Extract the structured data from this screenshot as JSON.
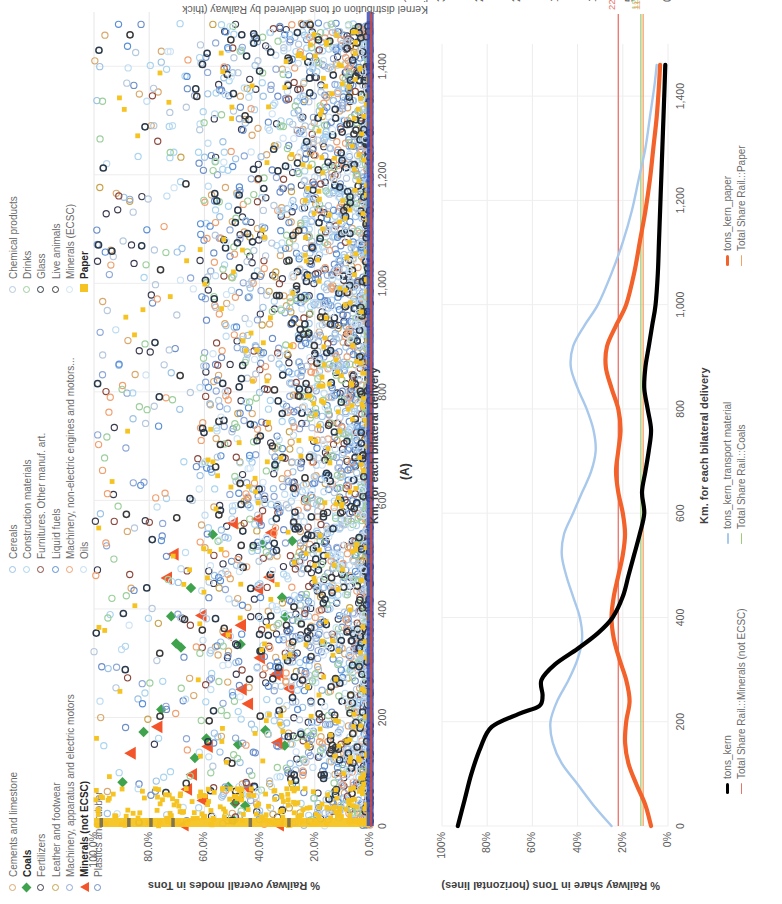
{
  "figure": {
    "panel_label": "(A)"
  },
  "chart_data": [
    {
      "id": "panel_a",
      "type": "scatter",
      "title": "",
      "xlabel": "Km. for each bilateral delivery",
      "ylabel": "% Railway overall modes in Tons",
      "xlim": [
        0,
        1500
      ],
      "ylim": [
        0,
        1.0
      ],
      "xticks": [
        "0",
        "200",
        "400",
        "600",
        "800",
        "1,000",
        "1,200",
        "1,400"
      ],
      "xtickvals": [
        0,
        200,
        400,
        600,
        800,
        1000,
        1200,
        1400
      ],
      "yticks": [
        "0.0%",
        "20.0%",
        "40.0%",
        "60.0%",
        "80.0%",
        "100.0%"
      ],
      "ytickvals": [
        0,
        0.2,
        0.4,
        0.6,
        0.8,
        1.0
      ],
      "grid": true,
      "legend_position": "top-left",
      "series": [
        {
          "name": "Cements and limestone",
          "marker": "circle-open",
          "color": "#d9a86c",
          "count": 260
        },
        {
          "name": "Coals",
          "marker": "diamond-filled",
          "color": "#3fa34d",
          "count": 22,
          "bold": true
        },
        {
          "name": "Fertilizers",
          "marker": "circle-open",
          "color": "#3b3b50",
          "count": 300
        },
        {
          "name": "Leather and footwear",
          "marker": "circle-open",
          "color": "#c9a24a",
          "count": 120
        },
        {
          "name": "Machinery, apparatus and electric motors",
          "marker": "circle-open",
          "color": "#8fa8d8",
          "count": 340
        },
        {
          "name": "Minerals (not ECSC)",
          "marker": "triangle-filled",
          "color": "#f4542a",
          "count": 26,
          "bold": true
        },
        {
          "name": "Plastics and rubber",
          "marker": "circle-open",
          "color": "#6d8fc9",
          "count": 300
        },
        {
          "name": "Cereals",
          "marker": "circle-open",
          "color": "#9dc3e6",
          "count": 320
        },
        {
          "name": "Construction materials",
          "marker": "circle-open",
          "color": "#aad4f0",
          "count": 330
        },
        {
          "name": "Furnitures. Other manuf. art.",
          "marker": "circle-open",
          "color": "#8c4a3f",
          "count": 180
        },
        {
          "name": "Liquid fuels",
          "marker": "circle-open",
          "color": "#5b8fd6",
          "count": 210
        },
        {
          "name": "Machinery, non-electric engines and motors...",
          "marker": "circle-open",
          "color": "#f0a070",
          "count": 230
        },
        {
          "name": "Oils",
          "marker": "circle-open",
          "color": "#bfdcf2",
          "count": 240
        },
        {
          "name": "Chemical products",
          "marker": "circle-open",
          "color": "#b6c8dd",
          "count": 330
        },
        {
          "name": "Drinks",
          "marker": "circle-open",
          "color": "#9ccf9c",
          "count": 270
        },
        {
          "name": "Glass",
          "marker": "circle-open-dark",
          "color": "#2b3a4a",
          "count": 300
        },
        {
          "name": "Live animals",
          "marker": "circle-open-dark",
          "color": "#3a3a3a",
          "count": 140
        },
        {
          "name": "Minerals (ECSC)",
          "marker": "circle-open",
          "color": "#cfe4f5",
          "count": 160
        },
        {
          "name": "Paper",
          "marker": "square-filled",
          "color": "#f5c322",
          "count": 520,
          "bold": true
        }
      ]
    },
    {
      "id": "panel_b",
      "type": "line",
      "title": "",
      "xlabel": "Km. for each bilateral delivery",
      "ylabel": "% Railway share in Tons (horizontal lines)",
      "y2label": "Kernel distribution of tons delivered by Railway (thick lines)",
      "xlim": [
        0,
        1500
      ],
      "ylim": [
        0,
        1.0
      ],
      "y2lim": [
        0,
        30000
      ],
      "xticks": [
        "0",
        "200",
        "400",
        "600",
        "800",
        "1,000",
        "1,200",
        "1,400"
      ],
      "xtickvals": [
        0,
        200,
        400,
        600,
        800,
        1000,
        1200,
        1400
      ],
      "yticks": [
        "0%",
        "20%",
        "40%",
        "60%",
        "80%",
        "100%"
      ],
      "ytickvals": [
        0,
        0.2,
        0.4,
        0.6,
        0.8,
        1.0
      ],
      "y2ticks": [
        "0",
        "5000",
        "10000",
        "15000",
        "20000",
        "25000",
        "30000"
      ],
      "y2tickvals": [
        0,
        5000,
        10000,
        15000,
        20000,
        25000,
        30000
      ],
      "grid": true,
      "legend_position": "bottom",
      "hlines": [
        {
          "label": "22%",
          "value": 0.22,
          "color": "#e8736a",
          "series": "Total Share Rail.::Minerals (not ECSC)"
        },
        {
          "label": "12%",
          "value": 0.12,
          "color": "#9ecb7a",
          "series": "Total Share Rail.::Coals"
        },
        {
          "label": "11%",
          "value": 0.11,
          "color": "#f4a261",
          "series": "Total Share Rail.::Paper"
        }
      ],
      "series": [
        {
          "name": "tons_kern",
          "color": "#000000",
          "style": "thick",
          "axis": "right"
        },
        {
          "name": "tons_kern_transport material",
          "color": "#a8c8ec",
          "style": "thin",
          "axis": "right"
        },
        {
          "name": "tons_kern_paper",
          "color": "#f2622a",
          "style": "thick",
          "axis": "right"
        },
        {
          "name": "Total Share Rail.::Minerals (not ECSC)",
          "color": "#e8736a",
          "style": "hline",
          "axis": "left"
        },
        {
          "name": "Total Share Rail.::Coals",
          "color": "#9ecb7a",
          "style": "hline",
          "axis": "left"
        },
        {
          "name": "Total Share Rail.::Paper",
          "color": "#f4a261",
          "style": "hline",
          "axis": "left"
        }
      ],
      "curves": {
        "tons_kern": [
          [
            0,
            0.93
          ],
          [
            50,
            0.9
          ],
          [
            100,
            0.87
          ],
          [
            150,
            0.83
          ],
          [
            190,
            0.78
          ],
          [
            215,
            0.66
          ],
          [
            230,
            0.57
          ],
          [
            250,
            0.555
          ],
          [
            280,
            0.56
          ],
          [
            310,
            0.5
          ],
          [
            340,
            0.4
          ],
          [
            370,
            0.31
          ],
          [
            400,
            0.245
          ],
          [
            440,
            0.2
          ],
          [
            480,
            0.175
          ],
          [
            520,
            0.15
          ],
          [
            560,
            0.125
          ],
          [
            600,
            0.105
          ],
          [
            640,
            0.115
          ],
          [
            680,
            0.1
          ],
          [
            720,
            0.085
          ],
          [
            760,
            0.075
          ],
          [
            800,
            0.09
          ],
          [
            840,
            0.105
          ],
          [
            880,
            0.1
          ],
          [
            920,
            0.085
          ],
          [
            960,
            0.07
          ],
          [
            1000,
            0.055
          ],
          [
            1060,
            0.045
          ],
          [
            1120,
            0.04
          ],
          [
            1180,
            0.035
          ],
          [
            1240,
            0.03
          ],
          [
            1300,
            0.025
          ],
          [
            1360,
            0.02
          ],
          [
            1420,
            0.015
          ],
          [
            1460,
            0.012
          ]
        ],
        "tons_kern_transport material": [
          [
            0,
            0.25
          ],
          [
            40,
            0.33
          ],
          [
            80,
            0.4
          ],
          [
            120,
            0.47
          ],
          [
            160,
            0.51
          ],
          [
            200,
            0.52
          ],
          [
            240,
            0.49
          ],
          [
            280,
            0.44
          ],
          [
            320,
            0.4
          ],
          [
            360,
            0.38
          ],
          [
            400,
            0.39
          ],
          [
            440,
            0.42
          ],
          [
            480,
            0.45
          ],
          [
            520,
            0.47
          ],
          [
            560,
            0.46
          ],
          [
            600,
            0.42
          ],
          [
            640,
            0.38
          ],
          [
            680,
            0.34
          ],
          [
            720,
            0.32
          ],
          [
            760,
            0.33
          ],
          [
            800,
            0.36
          ],
          [
            840,
            0.4
          ],
          [
            880,
            0.43
          ],
          [
            920,
            0.42
          ],
          [
            960,
            0.37
          ],
          [
            1000,
            0.31
          ],
          [
            1060,
            0.25
          ],
          [
            1120,
            0.2
          ],
          [
            1180,
            0.16
          ],
          [
            1240,
            0.13
          ],
          [
            1300,
            0.1
          ],
          [
            1360,
            0.08
          ],
          [
            1420,
            0.06
          ],
          [
            1460,
            0.05
          ]
        ],
        "tons_kern_paper": [
          [
            0,
            0.075
          ],
          [
            40,
            0.1
          ],
          [
            80,
            0.14
          ],
          [
            120,
            0.175
          ],
          [
            160,
            0.19
          ],
          [
            200,
            0.185
          ],
          [
            240,
            0.17
          ],
          [
            280,
            0.185
          ],
          [
            320,
            0.215
          ],
          [
            360,
            0.24
          ],
          [
            400,
            0.25
          ],
          [
            440,
            0.24
          ],
          [
            480,
            0.22
          ],
          [
            520,
            0.2
          ],
          [
            560,
            0.19
          ],
          [
            600,
            0.2
          ],
          [
            640,
            0.22
          ],
          [
            680,
            0.23
          ],
          [
            720,
            0.22
          ],
          [
            760,
            0.21
          ],
          [
            800,
            0.22
          ],
          [
            840,
            0.25
          ],
          [
            880,
            0.275
          ],
          [
            920,
            0.27
          ],
          [
            960,
            0.23
          ],
          [
            1000,
            0.185
          ],
          [
            1060,
            0.15
          ],
          [
            1120,
            0.125
          ],
          [
            1180,
            0.1
          ],
          [
            1240,
            0.08
          ],
          [
            1300,
            0.065
          ],
          [
            1360,
            0.05
          ],
          [
            1420,
            0.04
          ],
          [
            1460,
            0.035
          ]
        ]
      }
    }
  ]
}
